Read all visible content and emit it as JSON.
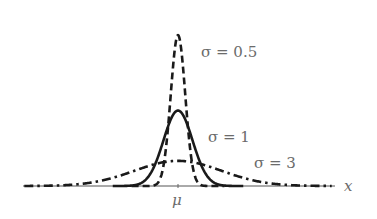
{
  "chart_data": {
    "type": "line",
    "title": "",
    "xlabel": "x",
    "ylabel": "",
    "x_tick_labels": [
      {
        "x": 0,
        "label": "μ"
      }
    ],
    "xlim": [
      -10.6,
      10.8
    ],
    "ylim": [
      0,
      0.8
    ],
    "grid": false,
    "legend": "inline labels",
    "series": [
      {
        "name": "σ = 0.5",
        "sigma": 0.5,
        "mu": 0,
        "style": "dashed",
        "peak": 0.798,
        "label_pos": [
          201,
          52
        ]
      },
      {
        "name": "σ = 1",
        "sigma": 1,
        "mu": 0,
        "style": "solid",
        "peak": 0.399,
        "label_pos": [
          208,
          138
        ]
      },
      {
        "name": "σ = 3",
        "sigma": 3,
        "mu": 0,
        "style": "dashdot",
        "peak": 0.133,
        "label_pos": [
          253,
          165
        ]
      }
    ]
  },
  "labels": {
    "s05": "σ = 0.5",
    "s1": "σ = 1",
    "s3": "σ = 3",
    "mu": "μ",
    "x": "x"
  }
}
